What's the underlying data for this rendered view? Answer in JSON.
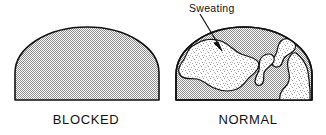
{
  "figure": {
    "width": 326,
    "height": 135,
    "background_color": "#ffffff",
    "line_color": "#111111",
    "fill_dense_color": "#b4b4b4",
    "fill_light_color": "#dedede"
  },
  "panels": [
    {
      "id": "blocked",
      "caption": "BLOCKED",
      "shape": "dome",
      "fill": "dense-stipple",
      "regions": []
    },
    {
      "id": "normal",
      "caption": "NORMAL",
      "shape": "dome",
      "fill": "dense-stipple",
      "regions": [
        {
          "name": "sweat-blob-large",
          "fill": "light-stipple"
        },
        {
          "name": "sweat-channel-upper",
          "fill": "light-stipple"
        },
        {
          "name": "sweat-channel-lower",
          "fill": "light-stipple"
        },
        {
          "name": "sweat-patch-right",
          "fill": "light-stipple"
        }
      ]
    }
  ],
  "annotations": [
    {
      "id": "sweating",
      "label": "Sweating",
      "has_arrow": true,
      "arrow_from": [
        200,
        14
      ],
      "arrow_to": [
        222,
        50
      ],
      "points_at": "sweat-blob-large"
    }
  ]
}
